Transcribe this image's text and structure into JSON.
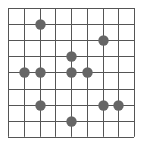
{
  "diagram": {
    "type": "grid-with-points",
    "columns": 8,
    "rows": 8,
    "origin": [
      8,
      8
    ],
    "cell_width": 15.75,
    "cell_height": 16.1,
    "line_color": "#555555",
    "dot_color": "#666666",
    "dot_radius": 5.2,
    "points": [
      {
        "col": 2,
        "row": 1
      },
      {
        "col": 6,
        "row": 2
      },
      {
        "col": 4,
        "row": 3
      },
      {
        "col": 1,
        "row": 4
      },
      {
        "col": 2,
        "row": 4
      },
      {
        "col": 4,
        "row": 4
      },
      {
        "col": 5,
        "row": 4
      },
      {
        "col": 2,
        "row": 6
      },
      {
        "col": 6,
        "row": 6
      },
      {
        "col": 7,
        "row": 6
      },
      {
        "col": 4,
        "row": 7
      }
    ]
  }
}
